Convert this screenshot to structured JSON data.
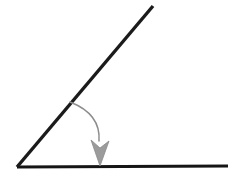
{
  "figure": {
    "background_color": "#ffffff",
    "width": 240,
    "height": 182
  },
  "geometry": {
    "vertex": {
      "x": 17,
      "y": 167
    },
    "horizontal_ray": {
      "name": "horizontal-ray",
      "from": {
        "x": 17,
        "y": 167
      },
      "to": {
        "x": 228,
        "y": 166
      },
      "color": "#151515",
      "stroke_width": 3.2
    },
    "diagonal_ray": {
      "name": "diagonal-ray",
      "from": {
        "x": 17,
        "y": 167
      },
      "to": {
        "x": 153,
        "y": 6
      },
      "color": "#1b1b1b",
      "stroke_width": 3.4
    },
    "angle_arc": {
      "name": "angle-arc",
      "from": {
        "x": 70,
        "y": 102
      },
      "control": {
        "x": 101,
        "y": 114
      },
      "to": {
        "x": 99,
        "y": 141
      },
      "color": "#8d8d8d",
      "stroke_width": 1.5
    },
    "arrow_head": {
      "name": "arrow-head",
      "tip": {
        "x": 100,
        "y": 166
      },
      "left": {
        "x": 91,
        "y": 140
      },
      "right": {
        "x": 109,
        "y": 141
      },
      "notch": {
        "x": 100,
        "y": 148
      },
      "fill_color": "#9b9b9b",
      "stroke_color": "#8a8a8a"
    }
  },
  "labels": {
    "angle_label": "",
    "ray_label_a": "",
    "ray_label_b": ""
  }
}
